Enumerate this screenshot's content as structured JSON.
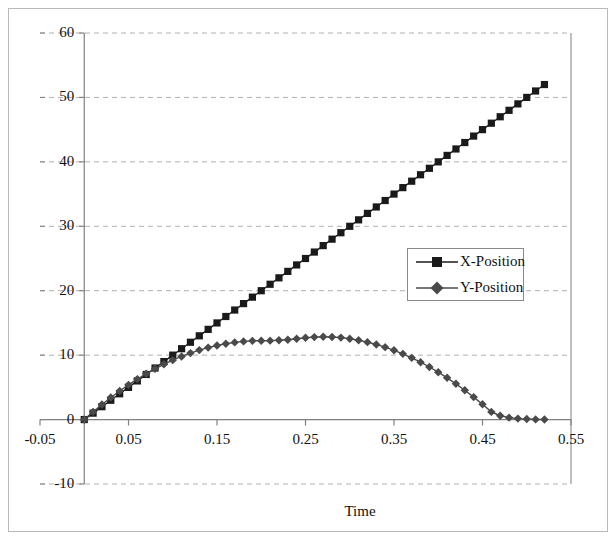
{
  "chart_data": {
    "type": "line",
    "title": "",
    "xlabel": "Time",
    "ylabel": "",
    "xlim": [
      -0.05,
      0.55
    ],
    "ylim": [
      -10,
      60
    ],
    "xticks": [
      "-0.05",
      "0.05",
      "0.15",
      "0.25",
      "0.35",
      "0.45",
      "0.55"
    ],
    "xtick_values": [
      -0.05,
      0.05,
      0.15,
      0.25,
      0.35,
      0.45,
      0.55
    ],
    "yticks": [
      "-10",
      "0",
      "10",
      "20",
      "30",
      "40",
      "50",
      "60"
    ],
    "ytick_values": [
      -10,
      0,
      10,
      20,
      30,
      40,
      50,
      60
    ],
    "grid": true,
    "grid_axis": "y",
    "grid_style": "dashed",
    "legend_position": "center-right",
    "marker_interval": 0.01,
    "x": [
      0.0,
      0.01,
      0.02,
      0.03,
      0.04,
      0.05,
      0.06,
      0.07,
      0.08,
      0.09,
      0.1,
      0.11,
      0.12,
      0.13,
      0.14,
      0.15,
      0.16,
      0.17,
      0.18,
      0.19,
      0.2,
      0.21,
      0.22,
      0.23,
      0.24,
      0.25,
      0.26,
      0.27,
      0.28,
      0.29,
      0.3,
      0.31,
      0.32,
      0.33,
      0.34,
      0.35,
      0.36,
      0.37,
      0.38,
      0.39,
      0.4,
      0.41,
      0.42,
      0.43,
      0.44,
      0.45,
      0.46,
      0.47,
      0.48,
      0.49,
      0.5,
      0.51,
      0.52
    ],
    "series": [
      {
        "name": "X-Position",
        "marker": "square",
        "color": "#1a1a1a",
        "values": [
          0.0,
          1.0,
          2.0,
          3.0,
          4.0,
          5.0,
          6.0,
          7.0,
          8.0,
          9.0,
          10.0,
          11.0,
          12.0,
          13.0,
          14.0,
          15.0,
          16.0,
          17.0,
          18.0,
          19.0,
          20.0,
          21.0,
          22.0,
          23.0,
          24.0,
          25.0,
          26.0,
          27.0,
          28.0,
          29.0,
          30.0,
          31.0,
          32.0,
          33.0,
          34.0,
          35.0,
          36.0,
          37.0,
          38.0,
          39.0,
          40.0,
          41.0,
          42.0,
          43.0,
          44.0,
          45.0,
          46.0,
          47.0,
          48.0,
          49.0,
          50.0,
          51.0,
          52.0
        ]
      },
      {
        "name": "Y-Position",
        "marker": "diamond",
        "color": "#4a4a4a",
        "values": [
          0.0,
          0.97,
          1.89,
          2.75,
          3.57,
          4.33,
          5.05,
          5.71,
          6.33,
          6.89,
          7.41,
          7.87,
          8.29,
          8.65,
          8.97,
          9.23,
          9.45,
          9.62,
          9.73,
          9.8,
          9.82,
          9.79,
          9.7,
          9.57,
          9.39,
          9.16,
          8.88,
          8.55,
          8.17,
          7.74,
          7.26,
          6.73,
          6.16,
          5.53,
          4.85,
          4.12,
          3.35,
          2.52,
          1.64,
          0.72,
          -0.25,
          -1.27,
          -2.34,
          -3.46,
          -4.63,
          -5.85,
          -7.12,
          -8.44,
          -9.81,
          -11.23,
          -12.7,
          -14.22,
          -15.79
        ]
      }
    ],
    "y_position_display": [
      0.0,
      1.2,
      2.35,
      3.42,
      4.44,
      5.39,
      6.28,
      7.11,
      7.88,
      8.58,
      9.22,
      9.8,
      10.32,
      10.78,
      11.17,
      11.5,
      11.77,
      11.98,
      12.13,
      12.22,
      12.24,
      12.25,
      12.3,
      12.4,
      12.55,
      12.7,
      12.8,
      12.85,
      12.82,
      12.72,
      12.55,
      12.32,
      12.02,
      11.66,
      11.24,
      10.75,
      10.2,
      9.58,
      8.9,
      8.16,
      7.35,
      6.48,
      5.55,
      4.55,
      3.49,
      2.37,
      1.19,
      0.6,
      0.3,
      0.15,
      0.08,
      0.03,
      0.0
    ]
  },
  "legend": {
    "items": [
      {
        "label": "X-Position",
        "marker": "square-marker",
        "color": "#1a1a1a"
      },
      {
        "label": "Y-Position",
        "marker": "diamond-marker",
        "color": "#4a4a4a"
      }
    ]
  },
  "axes": {
    "x_title": "Time",
    "y_title": ""
  },
  "colors": {
    "series_x": "#1a1a1a",
    "series_y": "#4a4a4a",
    "grid": "#b0b0b0",
    "axis": "#808080",
    "frame": "#b9b9b9",
    "text": "#111111"
  }
}
